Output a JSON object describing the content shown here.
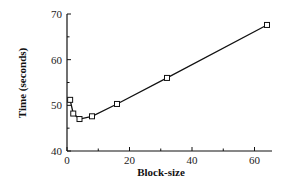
{
  "chart_data": {
    "type": "line",
    "title": "",
    "xlabel": "Block-size",
    "ylabel": "Time (seconds)",
    "xlim": [
      0,
      64
    ],
    "ylim": [
      40,
      70
    ],
    "xticks": [
      0,
      20,
      40,
      60
    ],
    "yticks": [
      40,
      50,
      60,
      70
    ],
    "grid": false,
    "legend": null,
    "series": [
      {
        "name": "Time",
        "marker": "square",
        "x": [
          1,
          2,
          4,
          8,
          16,
          32,
          64
        ],
        "values": [
          51.2,
          48.2,
          47.0,
          47.6,
          50.3,
          56.0,
          67.6
        ]
      }
    ]
  }
}
